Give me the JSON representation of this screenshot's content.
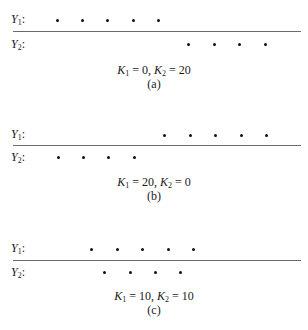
{
  "chart_data": [
    {
      "type": "scatter",
      "title": "(a)",
      "caption": "K1 = 0, K2 = 20",
      "K1": 0,
      "K2": 20,
      "series": [
        {
          "name": "Y1",
          "x": [
            57,
            82,
            107,
            133,
            158
          ]
        },
        {
          "name": "Y2",
          "x": [
            188,
            214,
            239,
            265
          ]
        }
      ]
    },
    {
      "type": "scatter",
      "title": "(b)",
      "caption": "K1 = 20, K2 = 0",
      "K1": 20,
      "K2": 0,
      "series": [
        {
          "name": "Y1",
          "x": [
            164,
            190,
            215,
            241,
            266
          ]
        },
        {
          "name": "Y2",
          "x": [
            58,
            83,
            108,
            134
          ]
        }
      ]
    },
    {
      "type": "scatter",
      "title": "(c)",
      "caption": "K1 = 10, K2 = 10",
      "K1": 10,
      "K2": 10,
      "series": [
        {
          "name": "Y1",
          "x": [
            91,
            117,
            142,
            168,
            193
          ]
        },
        {
          "name": "Y2",
          "x": [
            104,
            130,
            155,
            180
          ]
        }
      ]
    }
  ],
  "panels": [
    {
      "y1_label": "Y",
      "y1_sub": "1",
      "y2_label": "Y",
      "y2_sub": "2",
      "k1_val": "0",
      "k2_val": "20",
      "label": "(a)"
    },
    {
      "y1_label": "Y",
      "y1_sub": "1",
      "y2_label": "Y",
      "y2_sub": "2",
      "k1_val": "20",
      "k2_val": "0",
      "label": "(b)"
    },
    {
      "y1_label": "Y",
      "y1_sub": "1",
      "y2_label": "Y",
      "y2_sub": "2",
      "k1_val": "10",
      "k2_val": "10",
      "label": "(c)"
    }
  ],
  "common": {
    "colon": ":",
    "k_letter": "K",
    "k1_sub": "1",
    "k2_sub": "2",
    "eq": " = ",
    "comma": ", "
  }
}
